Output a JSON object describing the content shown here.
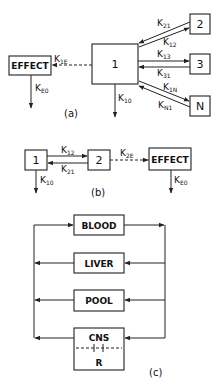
{
  "panel_a": {
    "caption": "(a)",
    "central": "1",
    "peripherals": [
      "2",
      "3",
      "N"
    ],
    "effect": "EFFECT",
    "rates": {
      "k21": {
        "base": "K",
        "sub": "21"
      },
      "k12": {
        "base": "K",
        "sub": "12"
      },
      "k13": {
        "base": "K",
        "sub": "13"
      },
      "k31": {
        "base": "K",
        "sub": "31"
      },
      "k1n": {
        "base": "K",
        "sub": "1N"
      },
      "kn1": {
        "base": "K",
        "sub": "N1"
      },
      "k1e": {
        "base": "K",
        "sub": "1E"
      },
      "k10": {
        "base": "K",
        "sub": "10"
      },
      "ke0": {
        "base": "K",
        "sub": "E0"
      }
    }
  },
  "panel_b": {
    "caption": "(b)",
    "box1": "1",
    "box2": "2",
    "effect": "EFFECT",
    "rates": {
      "k12": {
        "base": "K",
        "sub": "12"
      },
      "k21": {
        "base": "K",
        "sub": "21"
      },
      "k2e": {
        "base": "K",
        "sub": "2E"
      },
      "k10": {
        "base": "K",
        "sub": "10"
      },
      "ke0": {
        "base": "K",
        "sub": "E0"
      }
    }
  },
  "panel_c": {
    "caption": "(c)",
    "compartments": [
      "BLOOD",
      "LIVER",
      "POOL",
      "CNS"
    ],
    "cns_sub": "R"
  }
}
